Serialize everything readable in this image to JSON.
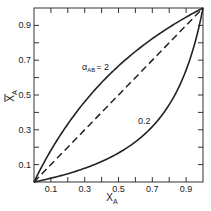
{
  "chart_data": {
    "type": "line",
    "title": "",
    "xlabel": "X_A",
    "ylabel": "X̄_A",
    "xlim": [
      0,
      1
    ],
    "ylim": [
      0,
      1
    ],
    "grid": false,
    "x_ticks": [
      "0.1",
      "0.3",
      "0.5",
      "0.7",
      "0.9"
    ],
    "y_ticks": [
      "0.1",
      "0.3",
      "0.5",
      "0.7",
      "0.9"
    ],
    "series": [
      {
        "name": "α_AB = 2",
        "style": "solid",
        "x": [
          0,
          0.1,
          0.2,
          0.3,
          0.4,
          0.5,
          0.6,
          0.7,
          0.8,
          0.9,
          1.0
        ],
        "values": [
          0,
          0.182,
          0.333,
          0.462,
          0.571,
          0.667,
          0.75,
          0.824,
          0.889,
          0.947,
          1.0
        ]
      },
      {
        "name": "0.2",
        "style": "solid",
        "x": [
          0,
          0.1,
          0.2,
          0.3,
          0.4,
          0.5,
          0.6,
          0.7,
          0.8,
          0.9,
          1.0
        ],
        "values": [
          0,
          0.022,
          0.048,
          0.079,
          0.118,
          0.167,
          0.231,
          0.318,
          0.444,
          0.643,
          1.0
        ]
      },
      {
        "name": "diagonal",
        "style": "dashed",
        "x": [
          0,
          1
        ],
        "values": [
          0,
          1
        ]
      }
    ],
    "annotations": [
      {
        "text": "α_AB = 2",
        "x": 0.38,
        "y": 0.66
      },
      {
        "text": "0.2",
        "x": 0.62,
        "y": 0.37
      }
    ]
  },
  "labels": {
    "alpha_main": "α",
    "alpha_sub": "AB",
    "alpha_eq": "= 2",
    "low_curve": "0.2",
    "xlabel_main": "X",
    "xlabel_sub": "A",
    "ylabel_main": "X",
    "ylabel_sub": "A"
  }
}
